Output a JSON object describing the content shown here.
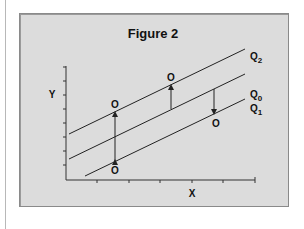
{
  "figure": {
    "title": "Figure 2",
    "x_axis_label": "X",
    "y_axis_label": "Y",
    "lines": [
      {
        "name": "Q2",
        "label_main": "Q",
        "label_sub": "2"
      },
      {
        "name": "Q0",
        "label_main": "Q",
        "label_sub": "0"
      },
      {
        "name": "Q1",
        "label_main": "Q",
        "label_sub": "1"
      }
    ],
    "points": [
      {
        "label": "O",
        "position": "upper-left"
      },
      {
        "label": "O",
        "position": "lower-left"
      },
      {
        "label": "O",
        "position": "upper-middle"
      },
      {
        "label": "O",
        "position": "lower-right"
      }
    ],
    "arrows": [
      {
        "description": "double-headed vertical arrow between Q2 and Q1 at left"
      },
      {
        "description": "upward arrow from Q0 to Q2 at middle"
      },
      {
        "description": "downward arrow from Q0 to Q1 at right"
      }
    ],
    "colors": {
      "background": "#dcdcdc",
      "line": "#222222",
      "border": "#8a8a8a"
    }
  }
}
